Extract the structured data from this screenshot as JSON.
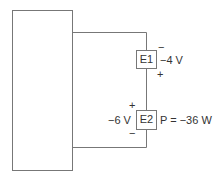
{
  "diagram": {
    "type": "circuit",
    "elements": [
      {
        "id": "E1",
        "label": "E1",
        "voltage": "−4 V",
        "polarity_top": "−",
        "polarity_bottom": "+"
      },
      {
        "id": "E2",
        "label": "E2",
        "voltage": "−6 V",
        "polarity_top": "+",
        "polarity_bottom": "−",
        "power": "P = −36 W"
      }
    ],
    "network_block": {
      "label": ""
    },
    "colors": {
      "line": "#777777",
      "text": "#333333",
      "background": "#ffffff"
    }
  }
}
